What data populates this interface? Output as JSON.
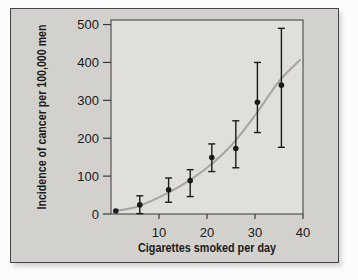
{
  "figure": {
    "page_bg": "#fcfcfc",
    "panel_bg": "#d2d1cd",
    "plot_bg": "#e0dfdc",
    "border_color": "#454545",
    "axis_color": "#3a3a3a",
    "curve_color": "#a8a49b",
    "point_color": "#1b1b1b",
    "text_color": "#1a1a1a"
  },
  "chart_data": {
    "type": "scatter",
    "title": "",
    "xlabel": "Cigarettes smoked per day",
    "ylabel": "Incidence of cancer per 100,000 men",
    "xlim": [
      0,
      40
    ],
    "ylim": [
      0,
      512
    ],
    "x_ticks": [
      10,
      20,
      30,
      40
    ],
    "y_ticks": [
      0,
      100,
      200,
      300,
      400,
      500
    ],
    "grid": false,
    "legend": null,
    "points": [
      {
        "x": 1,
        "y": 8,
        "lo": null,
        "hi": null
      },
      {
        "x": 6,
        "y": 24,
        "lo": 1,
        "hi": 48
      },
      {
        "x": 12,
        "y": 64,
        "lo": 31,
        "hi": 95
      },
      {
        "x": 16.5,
        "y": 88,
        "lo": 46,
        "hi": 117
      },
      {
        "x": 21,
        "y": 149,
        "lo": 112,
        "hi": 185
      },
      {
        "x": 26,
        "y": 173,
        "lo": 122,
        "hi": 246
      },
      {
        "x": 30.5,
        "y": 295,
        "lo": 215,
        "hi": 400
      },
      {
        "x": 35.5,
        "y": 340,
        "lo": 176,
        "hi": 490
      }
    ],
    "curve": [
      [
        0.8,
        8
      ],
      [
        5,
        18
      ],
      [
        10,
        44
      ],
      [
        15,
        78
      ],
      [
        20,
        122
      ],
      [
        25,
        180
      ],
      [
        30,
        260
      ],
      [
        35,
        350
      ],
      [
        39.5,
        408
      ]
    ]
  }
}
